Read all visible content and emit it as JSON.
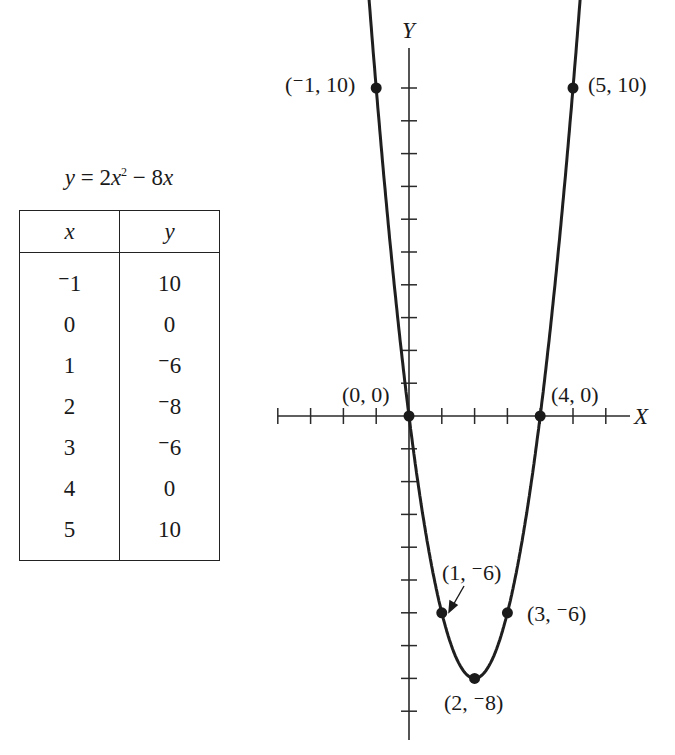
{
  "equation": {
    "text_y": "y",
    "eq": " = 2",
    "text_x": "x",
    "exp": "2",
    "rest_minus": " − 8",
    "text_x2": "x"
  },
  "table": {
    "headers": [
      "x",
      "y"
    ],
    "rows": [
      {
        "x": "⁻1",
        "y": "10"
      },
      {
        "x": "0",
        "y": "0"
      },
      {
        "x": "1",
        "y": "⁻6"
      },
      {
        "x": "2",
        "y": "⁻8"
      },
      {
        "x": "3",
        "y": "⁻6"
      },
      {
        "x": "4",
        "y": "0"
      },
      {
        "x": "5",
        "y": "10"
      }
    ]
  },
  "axes": {
    "x_label": "X",
    "y_label": "Y"
  },
  "point_labels": {
    "p_m1": "(⁻1, 10)",
    "p_0": "(0, 0)",
    "p_1": "(1, ⁻6)",
    "p_2": "(2, ⁻8)",
    "p_3": "(3, ⁻6)",
    "p_4": "(4, 0)",
    "p_5": "(5, 10)"
  },
  "chart_data": {
    "type": "line",
    "xlabel": "X",
    "ylabel": "Y",
    "x": [
      -1,
      0,
      1,
      2,
      3,
      4,
      5
    ],
    "series": [
      {
        "name": "y = 2x^2 - 8x",
        "values": [
          10,
          0,
          -6,
          -8,
          -6,
          0,
          10
        ]
      }
    ],
    "xlim": [
      -4,
      6
    ],
    "ylim": [
      -10,
      11
    ],
    "grid": false,
    "annotations": [
      "(-1, 10)",
      "(0, 0)",
      "(1, -6)",
      "(2, -8)",
      "(3, -6)",
      "(4, 0)",
      "(5, 10)"
    ],
    "table": {
      "columns": [
        "x",
        "y"
      ],
      "rows": [
        [
          -1,
          10
        ],
        [
          0,
          0
        ],
        [
          1,
          -6
        ],
        [
          2,
          -8
        ],
        [
          3,
          -6
        ],
        [
          4,
          0
        ],
        [
          5,
          10
        ]
      ]
    }
  }
}
